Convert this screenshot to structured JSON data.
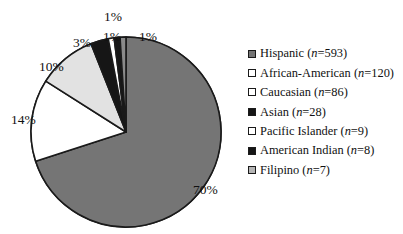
{
  "chart_data": {
    "type": "pie",
    "title": "",
    "subtitle": "",
    "xlabel": "",
    "ylabel": "",
    "legend_position": "right",
    "grid": false,
    "start_angle_deg": 0,
    "direction": "clockwise",
    "categories": [
      "Hispanic",
      "African-American",
      "Caucasian",
      "Asian",
      "Pacific Islander",
      "American Indian",
      "Filipino"
    ],
    "values": [
      70,
      14,
      10,
      3,
      1,
      1,
      1
    ],
    "counts": [
      593,
      120,
      86,
      28,
      9,
      8,
      7
    ],
    "slice_colors": [
      "#757575",
      "#ffffff",
      "#e2e2e2",
      "#161616",
      "#ffffff",
      "#161616",
      "#8a8a8a"
    ],
    "slice_stroke": "#1a1a1a",
    "data_labels": [
      "70%",
      "14%",
      "10%",
      "3%",
      "1%",
      "1%",
      "1%"
    ],
    "slices": [
      {
        "label": "Hispanic",
        "value": 70,
        "count": 593,
        "data_label": "70%",
        "color": "#757575"
      },
      {
        "label": "African-American",
        "value": 14,
        "count": 120,
        "data_label": "14%",
        "color": "#ffffff"
      },
      {
        "label": "Caucasian",
        "value": 10,
        "count": 86,
        "data_label": "10%",
        "color": "#e2e2e2"
      },
      {
        "label": "Asian",
        "value": 3,
        "count": 28,
        "data_label": "3%",
        "color": "#161616"
      },
      {
        "label": "Pacific Islander",
        "value": 1,
        "count": 9,
        "data_label": "1%",
        "color": "#ffffff"
      },
      {
        "label": "American Indian",
        "value": 1,
        "count": 8,
        "data_label": "1%",
        "color": "#161616"
      },
      {
        "label": "Filipino",
        "value": 1,
        "count": 7,
        "data_label": "1%",
        "color": "#8a8a8a"
      }
    ]
  },
  "pie": {
    "labels": {
      "hispanic_pct": "70%",
      "african_american_pct": "14%",
      "caucasian_pct": "10%",
      "asian_pct": "3%",
      "pacific_islander_pct": "1%",
      "american_indian_pct": "1%",
      "filipino_pct": "1%"
    }
  },
  "legend": {
    "items": [
      {
        "name": "Hispanic",
        "n_prefix": "(",
        "n_italic": "n",
        "n_value": "=593)",
        "swatch": "#757575",
        "full": "Hispanic (n=593)"
      },
      {
        "name": "African-American",
        "n_prefix": "(",
        "n_italic": "n",
        "n_value": "=120)",
        "swatch": "#ffffff",
        "full": "African-American (n=120)"
      },
      {
        "name": "Caucasian",
        "n_prefix": "(",
        "n_italic": "n",
        "n_value": "=86)",
        "swatch": "#ffffff",
        "full": "Caucasian (n=86)"
      },
      {
        "name": "Asian",
        "n_prefix": "(",
        "n_italic": "n",
        "n_value": "=28)",
        "swatch": "#161616",
        "full": "Asian (n=28)"
      },
      {
        "name": "Pacific Islander",
        "n_prefix": "(",
        "n_italic": "n",
        "n_value": "=9)",
        "swatch": "#ffffff",
        "full": "Pacific Islander (n=9)"
      },
      {
        "name": "American Indian",
        "n_prefix": "(",
        "n_italic": "n",
        "n_value": "=8)",
        "swatch": "#161616",
        "full": "American Indian (n=8)"
      },
      {
        "name": "Filipino",
        "n_prefix": "(",
        "n_italic": "n",
        "n_value": "=7)",
        "swatch": "#b5b5b5",
        "full": "Filipino (n=7)"
      }
    ]
  },
  "colors": {
    "background": "#ffffff",
    "text": "#111111",
    "outline": "#1a1a1a",
    "gray_main": "#757575",
    "gray_light": "#e2e2e2",
    "black": "#161616",
    "white": "#ffffff"
  }
}
